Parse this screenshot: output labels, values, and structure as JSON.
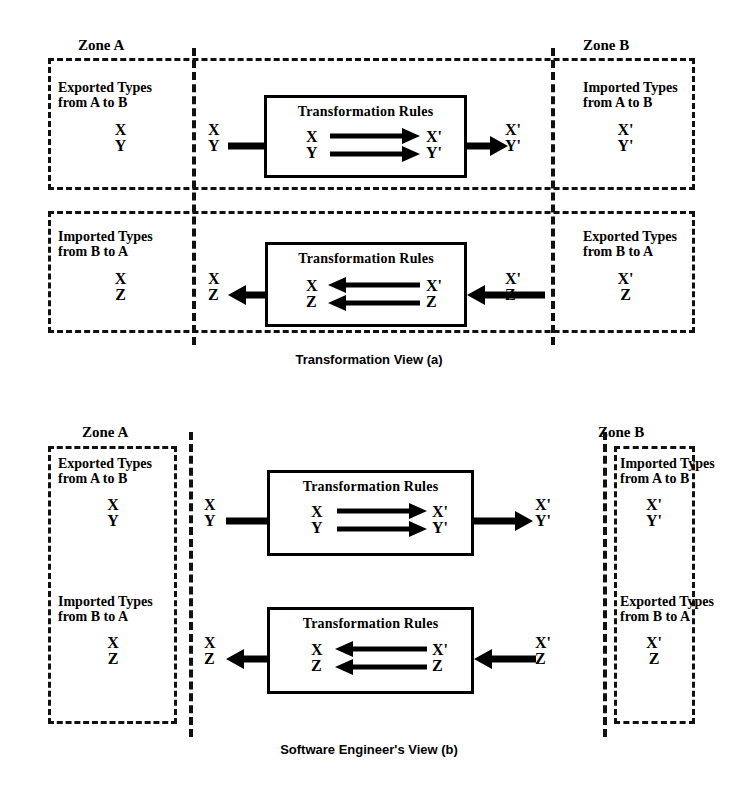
{
  "figure": {
    "panels": [
      {
        "id": "a",
        "caption": "Transformation View  (a)",
        "zone_a_label": "Zone A",
        "zone_b_label": "Zone B",
        "rows": [
          {
            "id": "a-row1",
            "direction": "right",
            "left_block_title": "Exported Types\nfrom A to B",
            "left_block_types": "X\nY",
            "left_edge_types": "X\nY",
            "rules_title": "Transformation Rules",
            "rules_in_types": "X\nY",
            "rules_out_types": "X'\nY'",
            "right_edge_types": "X'\nY'",
            "right_block_title": "Imported Types\nfrom A to B",
            "right_block_types": "X'\nY'"
          },
          {
            "id": "a-row2",
            "direction": "left",
            "left_block_title": "Imported Types\nfrom B to A",
            "left_block_types": "X\nZ",
            "left_edge_types": "X\nZ",
            "rules_title": "Transformation Rules",
            "rules_in_types": "X\nZ",
            "rules_out_types": "X'\nZ",
            "right_edge_types": "X'\nZ",
            "right_block_title": "Exported Types\nfrom B to A",
            "right_block_types": "X'\nZ"
          }
        ]
      },
      {
        "id": "b",
        "caption": "Software Engineer's View  (b)",
        "zone_a_label": "Zone A",
        "zone_b_label": "Zone B",
        "rows": [
          {
            "id": "b-row1",
            "direction": "right",
            "left_block_title": "Exported Types\nfrom A to B",
            "left_block_types": "X\nY",
            "left_edge_types": "X\nY",
            "rules_title": "Transformation Rules",
            "rules_in_types": "X\nY",
            "rules_out_types": "X'\nY'",
            "right_edge_types": "X'\nY'",
            "right_block_title": "Imported Types\nfrom A to B",
            "right_block_types": "X'\nY'"
          },
          {
            "id": "b-row2",
            "direction": "left",
            "left_block_title": "Imported Types\nfrom B to A",
            "left_block_types": "X\nZ",
            "left_edge_types": "X\nZ",
            "rules_title": "Transformation Rules",
            "rules_in_types": "X\nZ",
            "rules_out_types": "X'\nZ",
            "right_edge_types": "X'\nZ",
            "right_block_title": "Exported Types\nfrom B to A",
            "right_block_types": "X'\nZ"
          }
        ]
      }
    ],
    "colors": {
      "ink": "#111111",
      "paper": "#ffffff"
    }
  }
}
